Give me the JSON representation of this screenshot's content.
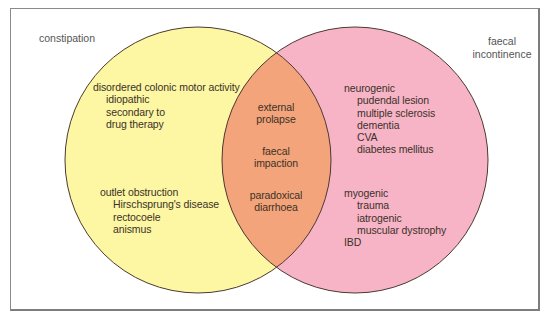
{
  "diagram": {
    "type": "venn",
    "colors": {
      "left_fill": "#fdf6a3",
      "right_fill": "#f8b4c7",
      "overlap_fill": "#f3a47a",
      "outline": "#4a3a30",
      "text": "#3a3228"
    },
    "sets": {
      "left": {
        "label": "constipation",
        "groups": [
          {
            "heading": "disordered colonic motor activity",
            "items": [
              "idiopathic",
              "secondary to",
              "drug therapy"
            ]
          },
          {
            "heading": "outlet obstruction",
            "items": [
              "Hirschsprung's disease",
              "rectocoele",
              "anismus"
            ]
          }
        ]
      },
      "right": {
        "label_line1": "faecal",
        "label_line2": "incontinence",
        "groups": [
          {
            "heading": "neurogenic",
            "items": [
              "pudendal lesion",
              "multiple sclerosis",
              "dementia",
              "CVA",
              "diabetes mellitus"
            ]
          },
          {
            "heading": "myogenic",
            "items": [
              "trauma",
              "iatrogenic",
              "muscular dystrophy"
            ]
          },
          {
            "heading": "IBD",
            "items": []
          }
        ]
      },
      "overlap": {
        "items": [
          {
            "line1": "external",
            "line2": "prolapse"
          },
          {
            "line1": "faecal",
            "line2": "impaction"
          },
          {
            "line1": "paradoxical",
            "line2": "diarrhoea"
          }
        ]
      }
    }
  }
}
